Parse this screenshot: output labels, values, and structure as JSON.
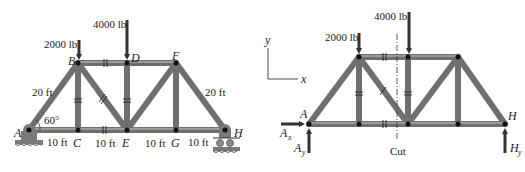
{
  "left_figure": {
    "title": "Truss with supports",
    "loads": [
      {
        "label": "2000 lb",
        "joint": "B"
      },
      {
        "label": "4000 lb",
        "joint": "D"
      }
    ],
    "joints": {
      "A": "A",
      "B": "B",
      "C": "C",
      "D": "D",
      "E": "E",
      "F": "F",
      "G": "G",
      "H": "H"
    },
    "dimensions": {
      "AB": "20 ft",
      "FH": "20 ft",
      "AC": "10 ft",
      "CE": "10 ft",
      "EG": "10 ft",
      "GH": "10 ft"
    },
    "angle": "60°"
  },
  "right_figure": {
    "title": "Free-body diagram with section cut",
    "loads": [
      {
        "label": "2000 lb"
      },
      {
        "label": "4000 lb"
      }
    ],
    "joints": {
      "A": "A",
      "H": "H"
    },
    "reactions": {
      "Ax_main": "A",
      "Ax_sub": "x",
      "Ay_main": "A",
      "Ay_sub": "y",
      "Hy_main": "H",
      "Hy_sub": "y"
    },
    "axes": {
      "x": "x",
      "y": "y"
    },
    "cut_label": "Cut"
  }
}
